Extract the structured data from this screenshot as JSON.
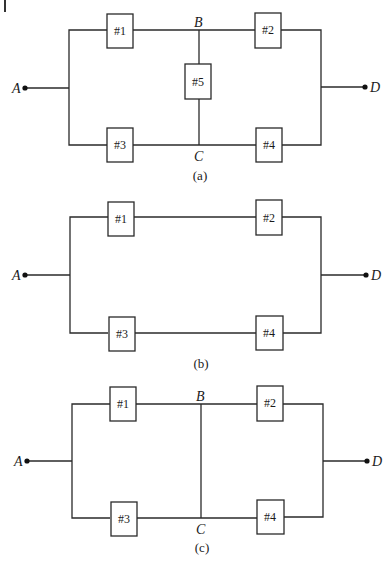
{
  "figure": {
    "panels": [
      {
        "id": "a",
        "caption": "(a)",
        "description": "Bridge network: A to D with components #1..#4 and bridge component #5 between B and C",
        "nodes": {
          "A": "A",
          "B": "B",
          "C": "C",
          "D": "D"
        },
        "components": [
          "#1",
          "#2",
          "#3",
          "#4",
          "#5"
        ]
      },
      {
        "id": "b",
        "caption": "(b)",
        "description": "Series-parallel: two parallel paths (#1-#2) and (#3-#4) between A and D",
        "nodes": {
          "A": "A",
          "D": "D"
        },
        "components": [
          "#1",
          "#2",
          "#3",
          "#4"
        ]
      },
      {
        "id": "c",
        "caption": "(c)",
        "description": "Parallel-series: (#1 || #3) in series with (#2 || #4), B and C shorted",
        "nodes": {
          "A": "A",
          "B": "B",
          "C": "C",
          "D": "D"
        },
        "components": [
          "#1",
          "#2",
          "#3",
          "#4"
        ]
      }
    ]
  }
}
